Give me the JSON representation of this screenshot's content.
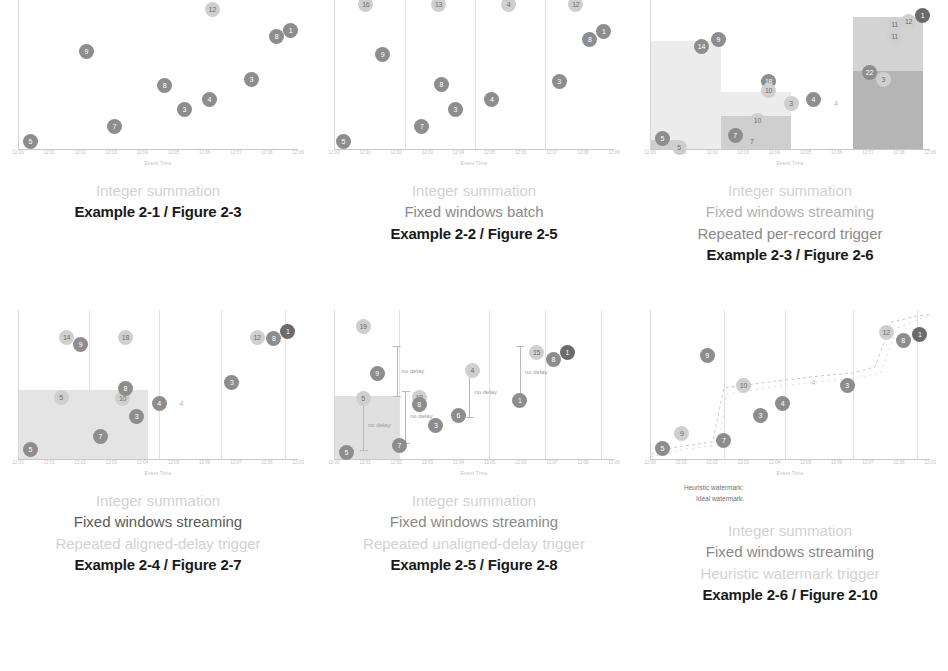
{
  "figure": {
    "axis_title": "Event Time",
    "x_ticks": [
      "12:00",
      "12:01",
      "12:02",
      "12:03",
      "12:04",
      "12:05",
      "12:06",
      "12:07",
      "12:08",
      "12:09"
    ]
  },
  "panels": [
    {
      "id": "example-2-1",
      "caption_lines": [
        {
          "text": "Integer summation",
          "weight": "faint"
        },
        {
          "text": "Example 2-1 / Figure 2-3",
          "weight": "title"
        }
      ],
      "chart_data": {
        "type": "scatter",
        "title": "Integer summation",
        "xlabel": "Event Time",
        "ylabel": "Processing Time",
        "xlim": [
          0,
          100
        ],
        "ylim": [
          0,
          100
        ],
        "grid": false,
        "window_boundaries": [],
        "bars": [],
        "points": [
          {
            "label": "5",
            "x": 4,
            "y": 6,
            "style": "normal"
          },
          {
            "label": "9",
            "x": 24,
            "y": 66,
            "style": "normal"
          },
          {
            "label": "7",
            "x": 34,
            "y": 16,
            "style": "normal"
          },
          {
            "label": "8",
            "x": 52,
            "y": 43,
            "style": "normal"
          },
          {
            "label": "3",
            "x": 59,
            "y": 27,
            "style": "normal"
          },
          {
            "label": "4",
            "x": 68,
            "y": 34,
            "style": "normal"
          },
          {
            "label": "12",
            "x": 69,
            "y": 94,
            "style": "light"
          },
          {
            "label": "3",
            "x": 83,
            "y": 47,
            "style": "normal"
          },
          {
            "label": "8",
            "x": 92,
            "y": 76,
            "style": "normal"
          },
          {
            "label": "1",
            "x": 97,
            "y": 80,
            "style": "normal"
          }
        ]
      }
    },
    {
      "id": "example-2-2",
      "caption_lines": [
        {
          "text": "Integer summation",
          "weight": "faint"
        },
        {
          "text": "Fixed windows batch",
          "weight": "grey"
        },
        {
          "text": "Example 2-2 / Figure 2-5",
          "weight": "title"
        }
      ],
      "chart_data": {
        "type": "scatter",
        "title": "Integer summation, fixed windows batch",
        "xlabel": "Event Time",
        "ylabel": "Processing Time",
        "xlim": [
          0,
          100
        ],
        "ylim": [
          0,
          100
        ],
        "grid": true,
        "window_boundaries": [
          25,
          50,
          75
        ],
        "bars": [],
        "window_totals": [
          {
            "label": "16",
            "x": 11,
            "y": 97
          },
          {
            "label": "13",
            "x": 37,
            "y": 97
          },
          {
            "label": "4",
            "x": 62,
            "y": 97
          },
          {
            "label": "12",
            "x": 86,
            "y": 97
          }
        ],
        "points": [
          {
            "label": "5",
            "x": 3,
            "y": 6,
            "style": "normal"
          },
          {
            "label": "9",
            "x": 17,
            "y": 64,
            "style": "normal"
          },
          {
            "label": "7",
            "x": 31,
            "y": 16,
            "style": "normal"
          },
          {
            "label": "3",
            "x": 43,
            "y": 27,
            "style": "normal"
          },
          {
            "label": "8",
            "x": 38,
            "y": 44,
            "style": "normal"
          },
          {
            "label": "4",
            "x": 56,
            "y": 34,
            "style": "normal"
          },
          {
            "label": "3",
            "x": 80,
            "y": 46,
            "style": "normal"
          },
          {
            "label": "8",
            "x": 91,
            "y": 74,
            "style": "normal"
          },
          {
            "label": "1",
            "x": 96,
            "y": 79,
            "style": "normal"
          }
        ]
      }
    },
    {
      "id": "example-2-3",
      "caption_lines": [
        {
          "text": "Integer summation",
          "weight": "faint"
        },
        {
          "text": "Fixed windows streaming",
          "weight": "mid"
        },
        {
          "text": "Repeated per-record trigger",
          "weight": "grey"
        },
        {
          "text": "Example 2-3 / Figure 2-6",
          "weight": "title"
        }
      ],
      "chart_data": {
        "type": "bar",
        "title": "Integer summation, fixed windows streaming, repeated per-record trigger",
        "xlabel": "Event Time",
        "ylabel": "Processing Time",
        "xlim": [
          0,
          100
        ],
        "ylim": [
          0,
          100
        ],
        "grid": false,
        "categories": [
          "12:00-12:02",
          "12:02-12:04",
          "12:04-12:06",
          "12:06-12:08"
        ],
        "values": [
          72,
          38,
          0,
          88
        ],
        "bars": [
          {
            "x0": 0,
            "x1": 25,
            "top": 72,
            "fill": "#ececec"
          },
          {
            "x0": 25,
            "x1": 50,
            "top": 38,
            "fill": "#ececec"
          },
          {
            "x0": 25,
            "x1": 50,
            "top": 22,
            "fill": "#cfcfcf"
          },
          {
            "x0": 0,
            "x1": 10,
            "top": 6,
            "fill": "#cfcfcf"
          },
          {
            "x0": 72,
            "x1": 97,
            "top": 88,
            "fill": "#d3d3d3"
          },
          {
            "x0": 72,
            "x1": 97,
            "top": 52,
            "fill": "#b5b5b5"
          }
        ],
        "points": [
          {
            "label": "5",
            "x": 4,
            "y": 8,
            "style": "normal"
          },
          {
            "label": "5",
            "x": 10,
            "y": 2,
            "style": "light"
          },
          {
            "label": "14",
            "x": 18,
            "y": 69,
            "style": "normal"
          },
          {
            "label": "9",
            "x": 24,
            "y": 74,
            "style": "normal"
          },
          {
            "label": "7",
            "x": 30,
            "y": 10,
            "style": "normal"
          },
          {
            "label": "7",
            "x": 36,
            "y": 6,
            "style": "light"
          },
          {
            "label": "10",
            "x": 38,
            "y": 20,
            "style": "light"
          },
          {
            "label": "18",
            "x": 42,
            "y": 46,
            "style": "normal"
          },
          {
            "label": "10",
            "x": 42,
            "y": 40,
            "style": "light"
          },
          {
            "label": "3",
            "x": 50,
            "y": 31,
            "style": "light"
          },
          {
            "label": "4",
            "x": 58,
            "y": 34,
            "style": "normal"
          },
          {
            "label": "4",
            "x": 66,
            "y": 31,
            "style": "ghost"
          },
          {
            "label": "22",
            "x": 78,
            "y": 52,
            "style": "normal"
          },
          {
            "label": "3",
            "x": 83,
            "y": 47,
            "style": "light"
          },
          {
            "label": "11",
            "x": 87,
            "y": 84,
            "style": "light"
          },
          {
            "label": "11",
            "x": 87,
            "y": 76,
            "style": "light"
          },
          {
            "label": "12",
            "x": 92,
            "y": 86,
            "style": "light"
          },
          {
            "label": "1",
            "x": 97,
            "y": 90,
            "style": "dark"
          }
        ]
      }
    },
    {
      "id": "example-2-4",
      "caption_lines": [
        {
          "text": "Integer summation",
          "weight": "faint"
        },
        {
          "text": "Fixed windows streaming",
          "weight": "strong"
        },
        {
          "text": "Repeated aligned-delay trigger",
          "weight": "faint"
        },
        {
          "text": "Example 2-4 / Figure 2-7",
          "weight": "title"
        }
      ],
      "chart_data": {
        "type": "bar",
        "title": "Integer summation, fixed windows streaming, repeated aligned-delay trigger",
        "xlabel": "Event Time",
        "ylabel": "Processing Time",
        "xlim": [
          0,
          100
        ],
        "ylim": [
          0,
          100
        ],
        "grid": true,
        "window_boundaries": [
          25,
          50,
          72,
          95
        ],
        "bars": [
          {
            "x0": 0,
            "x1": 46,
            "top": 46,
            "fill": "#e4e4e4"
          }
        ],
        "points": [
          {
            "label": "5",
            "x": 4,
            "y": 7,
            "style": "normal"
          },
          {
            "label": "7",
            "x": 29,
            "y": 16,
            "style": "normal"
          },
          {
            "label": "5",
            "x": 15,
            "y": 42,
            "style": "light"
          },
          {
            "label": "10",
            "x": 37,
            "y": 41,
            "style": "light"
          },
          {
            "label": "8",
            "x": 38,
            "y": 48,
            "style": "normal"
          },
          {
            "label": "3",
            "x": 42,
            "y": 29,
            "style": "normal"
          },
          {
            "label": "14",
            "x": 17,
            "y": 82,
            "style": "light"
          },
          {
            "label": "9",
            "x": 22,
            "y": 77,
            "style": "normal"
          },
          {
            "label": "18",
            "x": 38,
            "y": 82,
            "style": "light"
          },
          {
            "label": "4",
            "x": 50,
            "y": 38,
            "style": "normal"
          },
          {
            "label": "4",
            "x": 58,
            "y": 38,
            "style": "ghost"
          },
          {
            "label": "3",
            "x": 76,
            "y": 52,
            "style": "normal"
          },
          {
            "label": "12",
            "x": 85,
            "y": 82,
            "style": "light"
          },
          {
            "label": "8",
            "x": 91,
            "y": 81,
            "style": "normal"
          },
          {
            "label": "1",
            "x": 96,
            "y": 86,
            "style": "dark"
          }
        ]
      }
    },
    {
      "id": "example-2-5",
      "caption_lines": [
        {
          "text": "Integer summation",
          "weight": "faint"
        },
        {
          "text": "Fixed windows streaming",
          "weight": "grey"
        },
        {
          "text": "Repeated unaligned-delay trigger",
          "weight": "faint"
        },
        {
          "text": "Example 2-5 / Figure 2-8",
          "weight": "title"
        }
      ],
      "chart_data": {
        "type": "bar",
        "title": "Integer summation, fixed windows streaming, repeated unaligned-delay trigger",
        "xlabel": "Event Time",
        "ylabel": "Processing Time",
        "xlim": [
          0,
          100
        ],
        "ylim": [
          0,
          100
        ],
        "grid": true,
        "window_boundaries": [
          23,
          55,
          75,
          95
        ],
        "bars": [
          {
            "x0": 0,
            "x1": 23,
            "top": 42,
            "fill": "#e0e0e0"
          }
        ],
        "delay_annotations": [
          {
            "label": "no delay",
            "x": 10,
            "y0": 6,
            "y1": 40
          },
          {
            "label": "no delay",
            "x": 22,
            "y0": 42,
            "y1": 76
          },
          {
            "label": "no delay",
            "x": 25,
            "y0": 11,
            "y1": 46
          },
          {
            "label": "no delay",
            "x": 48,
            "y0": 28,
            "y1": 62
          },
          {
            "label": "no delay",
            "x": 66,
            "y0": 40,
            "y1": 76
          }
        ],
        "points": [
          {
            "label": "5",
            "x": 4,
            "y": 5,
            "style": "normal"
          },
          {
            "label": "5",
            "x": 10,
            "y": 41,
            "style": "light"
          },
          {
            "label": "19",
            "x": 10,
            "y": 89,
            "style": "light"
          },
          {
            "label": "9",
            "x": 15,
            "y": 58,
            "style": "normal"
          },
          {
            "label": "7",
            "x": 23,
            "y": 10,
            "style": "normal"
          },
          {
            "label": "18",
            "x": 30,
            "y": 42,
            "style": "light"
          },
          {
            "label": "8",
            "x": 30,
            "y": 37,
            "style": "normal"
          },
          {
            "label": "3",
            "x": 36,
            "y": 23,
            "style": "normal"
          },
          {
            "label": "6",
            "x": 44,
            "y": 30,
            "style": "normal"
          },
          {
            "label": "4",
            "x": 49,
            "y": 60,
            "style": "light"
          },
          {
            "label": "1",
            "x": 66,
            "y": 40,
            "style": "normal"
          },
          {
            "label": "15",
            "x": 72,
            "y": 72,
            "style": "light"
          },
          {
            "label": "8",
            "x": 78,
            "y": 67,
            "style": "normal"
          },
          {
            "label": "1",
            "x": 83,
            "y": 72,
            "style": "dark"
          }
        ]
      }
    },
    {
      "id": "example-2-6",
      "caption_lines": [
        {
          "text": "Integer summation",
          "weight": "faint"
        },
        {
          "text": "Fixed windows streaming",
          "weight": "grey"
        },
        {
          "text": "Heuristic watermark trigger",
          "weight": "faint"
        },
        {
          "text": "Example 2-6 / Figure 2-10",
          "weight": "title"
        }
      ],
      "legend": {
        "heuristic_label": "Heuristic watermark:",
        "ideal_label": "Ideal watermark:"
      },
      "chart_data": {
        "type": "line",
        "title": "Integer summation, fixed windows streaming, heuristic watermark trigger",
        "xlabel": "Event Time",
        "ylabel": "Processing Time",
        "xlim": [
          0,
          100
        ],
        "ylim": [
          0,
          100
        ],
        "grid": true,
        "window_boundaries": [
          26,
          48,
          72,
          95
        ],
        "series": [
          {
            "name": "Heuristic watermark:",
            "color": "#c9c9c9",
            "dash": "3,3",
            "points": [
              [
                0,
                4
              ],
              [
                10,
                9
              ],
              [
                22,
                12
              ],
              [
                26,
                48
              ],
              [
                42,
                52
              ],
              [
                60,
                56
              ],
              [
                72,
                58
              ],
              [
                80,
                62
              ],
              [
                86,
                92
              ],
              [
                95,
                96
              ],
              [
                100,
                97
              ]
            ]
          },
          {
            "name": "Ideal watermark:",
            "color": "#dcdcdc",
            "dash": "2,4",
            "points": [
              [
                0,
                2
              ],
              [
                12,
                7
              ],
              [
                24,
                10
              ],
              [
                27,
                44
              ],
              [
                45,
                49
              ],
              [
                64,
                53
              ],
              [
                74,
                55
              ],
              [
                82,
                58
              ],
              [
                88,
                88
              ],
              [
                96,
                94
              ],
              [
                100,
                95
              ]
            ]
          }
        ],
        "points": [
          {
            "label": "5",
            "x": 4,
            "y": 8,
            "style": "normal"
          },
          {
            "label": "9",
            "x": 20,
            "y": 70,
            "style": "normal"
          },
          {
            "label": "9",
            "x": 11,
            "y": 18,
            "style": "light"
          },
          {
            "label": "7",
            "x": 26,
            "y": 13,
            "style": "normal"
          },
          {
            "label": "10",
            "x": 33,
            "y": 50,
            "style": "light"
          },
          {
            "label": "3",
            "x": 39,
            "y": 30,
            "style": "normal"
          },
          {
            "label": "4",
            "x": 47,
            "y": 38,
            "style": "normal"
          },
          {
            "label": "4",
            "x": 58,
            "y": 52,
            "style": "ghost"
          },
          {
            "label": "3",
            "x": 70,
            "y": 50,
            "style": "normal"
          },
          {
            "label": "12",
            "x": 84,
            "y": 85,
            "style": "light"
          },
          {
            "label": "8",
            "x": 90,
            "y": 80,
            "style": "normal"
          },
          {
            "label": "1",
            "x": 96,
            "y": 84,
            "style": "dark"
          }
        ]
      }
    }
  ]
}
